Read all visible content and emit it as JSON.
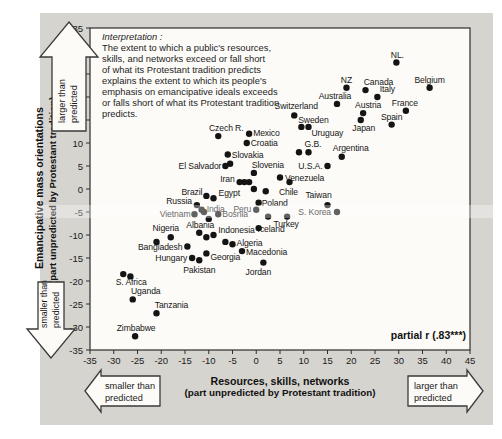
{
  "figure": {
    "interpretation": {
      "heading": "Interpretation :",
      "lines": [
        "The extent to which a public's resources,",
        "skills, and networks exceed or fall short",
        "of what its Protestant tradition predicts",
        "explains the extent to which its people's",
        "emphasis on emancipative ideals exceeds",
        "or falls short of what its Protestant tradition",
        "predicts."
      ]
    },
    "annotation": "partial r (.83***)",
    "arrows": {
      "up": {
        "line1": "larger than",
        "line2": "predicted"
      },
      "down": {
        "line1": "smaller than",
        "line2": "predicted"
      },
      "left": {
        "line1": "smaller than",
        "line2": "predicted"
      },
      "right": {
        "line1": "larger than",
        "line2": "predicted"
      }
    }
  },
  "chart_data": {
    "type": "scatter",
    "xlabel": "Resources, skills, networks",
    "xlabel_sub": "(part unpredicted by Protestant tradition)",
    "ylabel": "Emancipative mass orientations",
    "ylabel_sub": "(part unpredicted by Protestant tradition)",
    "xlim": [
      -35,
      45
    ],
    "ylim": [
      -35,
      35
    ],
    "grid": false,
    "xticks": [
      -35,
      -30,
      -25,
      -20,
      -15,
      -10,
      -5,
      0,
      5,
      10,
      15,
      20,
      25,
      30,
      35,
      40,
      45
    ],
    "yticks": [
      35,
      30,
      25,
      20,
      15,
      10,
      5,
      0,
      -5,
      -10,
      -15,
      -20,
      -25,
      -30,
      -35
    ],
    "partial_r": ".83***",
    "points": [
      {
        "name": "NL.",
        "x": 29.5,
        "y": 27.5,
        "dx": 1,
        "dy": -5,
        "a": "middle"
      },
      {
        "name": "NZ",
        "x": 19,
        "y": 22,
        "dx": 0,
        "dy": -5,
        "a": "middle"
      },
      {
        "name": "Canada",
        "x": 23,
        "y": 21.5,
        "dx": 13,
        "dy": -5,
        "a": "middle"
      },
      {
        "name": "Italy",
        "x": 25.5,
        "y": 20,
        "dx": 10,
        "dy": -5,
        "a": "middle"
      },
      {
        "name": "Belgium",
        "x": 36.5,
        "y": 22,
        "dx": 0,
        "dy": -5,
        "a": "middle"
      },
      {
        "name": "Australia",
        "x": 17,
        "y": 18.5,
        "dx": -2,
        "dy": -5,
        "a": "middle"
      },
      {
        "name": "Austria",
        "x": 22.5,
        "y": 16.5,
        "dx": 5,
        "dy": -5,
        "a": "middle"
      },
      {
        "name": "France",
        "x": 31.5,
        "y": 17,
        "dx": -1,
        "dy": -5,
        "a": "middle"
      },
      {
        "name": "Switzerland",
        "x": 8,
        "y": 16,
        "dx": 2,
        "dy": -6,
        "a": "middle"
      },
      {
        "name": "Sweden",
        "x": 9.5,
        "y": 13.5,
        "dx": 12,
        "dy": -4,
        "a": "middle"
      },
      {
        "name": "Uruguay",
        "x": 11,
        "y": 13.5,
        "dx": 3,
        "dy": 9,
        "a": "start"
      },
      {
        "name": "Japan",
        "x": 22,
        "y": 15,
        "dx": 3,
        "dy": 11,
        "a": "middle"
      },
      {
        "name": "Spain",
        "x": 28.5,
        "y": 14,
        "dx": 0,
        "dy": -5,
        "a": "middle"
      },
      {
        "name": "G.B.",
        "x": 9,
        "y": 8,
        "dx": 14,
        "dy": -5,
        "a": "middle"
      },
      {
        "name": "Argentina",
        "x": 18,
        "y": 7,
        "dx": 9,
        "dy": -6,
        "a": "middle"
      },
      {
        "name": "U.S.A.",
        "x": 15,
        "y": 5,
        "dx": -5,
        "dy": 3,
        "a": "end"
      },
      {
        "name": "Venezuela",
        "x": 5,
        "y": 2.5,
        "dx": 5,
        "dy": 3,
        "a": "start"
      },
      {
        "name": "Mexico",
        "x": -1.5,
        "y": 12,
        "dx": 4,
        "dy": 2,
        "a": "start"
      },
      {
        "name": "Czech R.",
        "x": -8,
        "y": 11.5,
        "dx": 8,
        "dy": -5,
        "a": "middle"
      },
      {
        "name": "Croatia",
        "x": -2,
        "y": 10,
        "dx": 4,
        "dy": 3,
        "a": "start"
      },
      {
        "name": "Slovakia",
        "x": -6,
        "y": 7.5,
        "dx": 4,
        "dy": 3,
        "a": "start"
      },
      {
        "name": "Slovenia",
        "x": -0.5,
        "y": 3.5,
        "dx": 14,
        "dy": -5,
        "a": "middle"
      },
      {
        "name": "El Salvador",
        "x": -6.5,
        "y": 5,
        "dx": -4,
        "dy": 3,
        "a": "end"
      },
      {
        "name": "Iran",
        "x": -3.5,
        "y": 1.5,
        "dx": -5,
        "dy": 0,
        "a": "end"
      },
      {
        "name": "Chile",
        "x": 7,
        "y": 1.5,
        "dx": -1,
        "dy": 13,
        "a": "middle"
      },
      {
        "name": "Taiwan",
        "x": 15,
        "y": -3.5,
        "dx": -9,
        "dy": -7,
        "a": "middle"
      },
      {
        "name": "S. Korea",
        "x": 17,
        "y": -5,
        "dx": -6,
        "dy": 3,
        "a": "end"
      },
      {
        "name": "Poland",
        "x": 0.5,
        "y": -3,
        "dx": 3,
        "dy": 3,
        "a": "start"
      },
      {
        "name": "Peru",
        "x": 0,
        "y": -4.5,
        "dx": -5,
        "dy": 2,
        "a": "end"
      },
      {
        "name": "Egypt",
        "x": -9,
        "y": -2,
        "dx": 5,
        "dy": -2,
        "a": "start"
      },
      {
        "name": "Brazil",
        "x": -10.5,
        "y": -1.5,
        "dx": -4,
        "dy": -1,
        "a": "end"
      },
      {
        "name": "Russia",
        "x": -12.5,
        "y": -3.5,
        "dx": -5,
        "dy": -1,
        "a": "end"
      },
      {
        "name": "India",
        "x": -11.5,
        "y": -4.5,
        "dx": 5,
        "dy": 2,
        "a": "start"
      },
      {
        "name": "Vietnam",
        "x": -13,
        "y": -5.5,
        "dx": -4,
        "dy": 3,
        "a": "end"
      },
      {
        "name": "Bosnia",
        "x": -8,
        "y": -5.5,
        "dx": 4,
        "dy": 3,
        "a": "start"
      },
      {
        "name": "Albania",
        "x": -12,
        "y": -9.5,
        "dx": 1,
        "dy": -5,
        "a": "middle"
      },
      {
        "name": "Nigeria",
        "x": -18,
        "y": -10.5,
        "dx": -5,
        "dy": -6,
        "a": "middle"
      },
      {
        "name": "Indonesia",
        "x": 0.5,
        "y": -8.5,
        "dx": -4,
        "dy": 5,
        "a": "end"
      },
      {
        "name": "Iceland",
        "x": 2.5,
        "y": -6,
        "dx": 3,
        "dy": 15,
        "a": "middle"
      },
      {
        "name": "Turkey",
        "x": 6.5,
        "y": -6,
        "dx": -1,
        "dy": 10,
        "a": "middle"
      },
      {
        "name": "Bangladesh",
        "x": -14.5,
        "y": -12.5,
        "dx": -5,
        "dy": 3,
        "a": "end"
      },
      {
        "name": "Algeria",
        "x": -5,
        "y": -12,
        "dx": 4,
        "dy": 2,
        "a": "start"
      },
      {
        "name": "Macedonia",
        "x": -3,
        "y": -13.5,
        "dx": 4,
        "dy": 4,
        "a": "start"
      },
      {
        "name": "Hungary",
        "x": -13.5,
        "y": -15,
        "dx": -5,
        "dy": 3,
        "a": "end"
      },
      {
        "name": "Georgia",
        "x": -10.5,
        "y": -14,
        "dx": 4,
        "dy": 7,
        "a": "start"
      },
      {
        "name": "Pakistan",
        "x": -12,
        "y": -15.5,
        "dx": 0,
        "dy": 13,
        "a": "middle"
      },
      {
        "name": "Jordan",
        "x": 1.5,
        "y": -16,
        "dx": -5,
        "dy": 12,
        "a": "middle"
      },
      {
        "name": "S. Africa",
        "x": -28,
        "y": -18.5,
        "dx": 8,
        "dy": 11,
        "a": "middle"
      },
      {
        "name": "Uganda",
        "x": -26,
        "y": -24,
        "dx": 13,
        "dy": -5,
        "a": "middle"
      },
      {
        "name": "Tanzania",
        "x": -21,
        "y": -27,
        "dx": 15,
        "dy": -5,
        "a": "middle"
      },
      {
        "name": "Zimbabwe",
        "x": -25.5,
        "y": -32,
        "dx": 1,
        "dy": -5,
        "a": "middle"
      }
    ],
    "extra_points": [
      [
        11,
        8
      ],
      [
        -2.5,
        1.5
      ],
      [
        -1.5,
        1.5
      ],
      [
        -0.5,
        0
      ],
      [
        2,
        -0.5
      ],
      [
        -5.5,
        5.5
      ],
      [
        -10.5,
        -10.5
      ],
      [
        -9,
        -10
      ],
      [
        -6.5,
        -11.5
      ],
      [
        -21,
        -11.5
      ],
      [
        -26.5,
        -19
      ],
      [
        -11,
        -5
      ],
      [
        -10,
        -6.5
      ]
    ]
  }
}
